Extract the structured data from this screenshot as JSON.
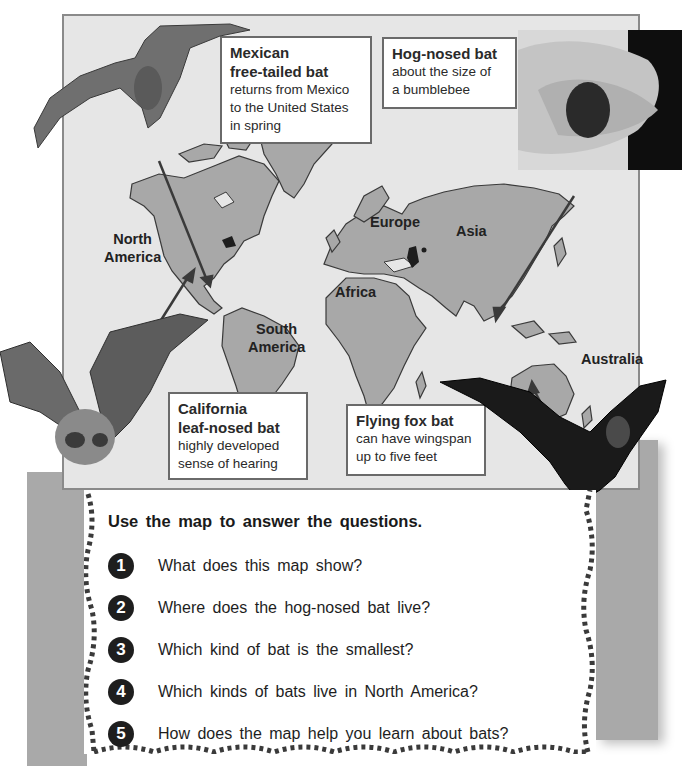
{
  "map": {
    "continents": [
      {
        "id": "north-america",
        "label": "North\nAmerica",
        "line1": "North",
        "line2": "America"
      },
      {
        "id": "south-america",
        "label": "South America",
        "line1": "South",
        "line2": "America"
      },
      {
        "id": "europe",
        "label": "Europe"
      },
      {
        "id": "asia",
        "label": "Asia"
      },
      {
        "id": "africa",
        "label": "Africa"
      },
      {
        "id": "australia",
        "label": "Australia"
      }
    ],
    "callouts": [
      {
        "id": "mexican-free-tailed",
        "title_line1": "Mexican",
        "title_line2": "free-tailed bat",
        "desc_line1": "returns from Mexico",
        "desc_line2": "to the United States",
        "desc_line3": "in spring"
      },
      {
        "id": "hog-nosed",
        "title": "Hog-nosed bat",
        "desc_line1": "about the size of",
        "desc_line2": "a bumblebee"
      },
      {
        "id": "california-leaf-nosed",
        "title_line1": "California",
        "title_line2": "leaf-nosed bat",
        "desc_line1": "highly developed",
        "desc_line2": "sense of hearing"
      },
      {
        "id": "flying-fox",
        "title": "Flying fox bat",
        "desc_line1": "can have wingspan",
        "desc_line2": "up to five feet"
      }
    ],
    "colors": {
      "ocean": "#e6e6e6",
      "land": "#a8a8a8",
      "outline": "#3a3a3a",
      "frame": "#8a8a8a"
    }
  },
  "questions": {
    "heading": "Use the map to answer the questions.",
    "items": [
      {
        "number": "1",
        "text": "What does this map show?"
      },
      {
        "number": "2",
        "text": "Where does the hog-nosed bat live?"
      },
      {
        "number": "3",
        "text": "Which kind of bat is the smallest?"
      },
      {
        "number": "4",
        "text": "Which kinds of bats live in North America?"
      },
      {
        "number": "5",
        "text": "How does the map help you learn about bats?"
      }
    ]
  }
}
